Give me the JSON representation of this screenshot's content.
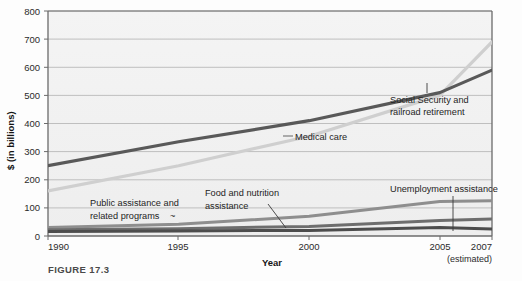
{
  "figure": {
    "number_label": "FIGURE 17.3",
    "caption": ""
  },
  "chart_data": {
    "type": "line",
    "title": "",
    "xlabel": "Year",
    "ylabel": "$ (in billions)",
    "grid": true,
    "legend_position": "inline-annotations",
    "x": [
      1990,
      1995,
      2000,
      2005,
      2007
    ],
    "xtick_labels": [
      "1990",
      "1995",
      "2000",
      "2005",
      "2007"
    ],
    "xtick_sublabels": [
      "",
      "",
      "",
      "",
      "(estimated)"
    ],
    "ytick_labels": [
      "0",
      "100",
      "200",
      "300",
      "400",
      "500",
      "600",
      "700",
      "800"
    ],
    "ytick_values": [
      0,
      100,
      200,
      300,
      400,
      500,
      600,
      700,
      800
    ],
    "xlim": [
      1990,
      2007
    ],
    "ylim": [
      0,
      800
    ],
    "series": [
      {
        "name": "Social Security and railroad retirement",
        "color": "#595959",
        "width": 3.2,
        "values": [
          250,
          335,
          410,
          510,
          590
        ]
      },
      {
        "name": "Medical care",
        "color": "#cfcfcf",
        "width": 3.2,
        "values": [
          160,
          250,
          355,
          500,
          690
        ]
      },
      {
        "name": "Food and nutrition assistance",
        "color": "#8e8e8e",
        "width": 3.0,
        "values": [
          30,
          42,
          70,
          123,
          125
        ]
      },
      {
        "name": "Public assistance and related programs",
        "color": "#6e6e6e",
        "width": 3.0,
        "values": [
          22,
          26,
          34,
          55,
          60
        ]
      },
      {
        "name": "Unemployment assistance",
        "color": "#4d4d4d",
        "width": 3.0,
        "values": [
          16,
          18,
          20,
          30,
          25
        ]
      }
    ],
    "annotations": [
      {
        "id": "medical-care",
        "text": "Medical care",
        "lines": [
          "Medical care"
        ],
        "x_px": 296,
        "y_px": 140,
        "leader": {
          "x1": 285,
          "y1": 136,
          "x2": 293,
          "y2": 136
        }
      },
      {
        "id": "social-security",
        "text": "Social Security and railroad retirement",
        "lines": [
          "Social Security and",
          "railroad retirement"
        ],
        "x_px": 392,
        "y_px": 102,
        "leader": {
          "x1": 427,
          "y1": 84,
          "x2": 427,
          "y2": 93
        }
      },
      {
        "id": "public-assistance",
        "text": "Public assistance and related programs",
        "lines": [
          "Public assistance and",
          "related programs"
        ],
        "x_px": 90,
        "y_px": 203,
        "tail": "~",
        "leader": {
          "x1": 178,
          "y1": 214,
          "x2": 196,
          "y2": 219
        }
      },
      {
        "id": "food-nutrition",
        "text": "Food and nutrition assistance",
        "lines": [
          "Food and nutrition",
          "assistance"
        ],
        "x_px": 205,
        "y_px": 193,
        "leader": {
          "x1": 270,
          "y1": 202,
          "x2": 284,
          "y2": 228
        }
      },
      {
        "id": "unemployment",
        "text": "Unemployment assistance",
        "lines": [
          "Unemployment assistance"
        ],
        "x_px": 390,
        "y_px": 190,
        "leader": {
          "x1": 453,
          "y1": 194,
          "x2": 453,
          "y2": 231
        }
      }
    ]
  },
  "colors": {
    "plot_background": "#f2f2f2",
    "gridline": "#b9b9b9",
    "axis": "#5f5f5f",
    "text": "#242424"
  }
}
